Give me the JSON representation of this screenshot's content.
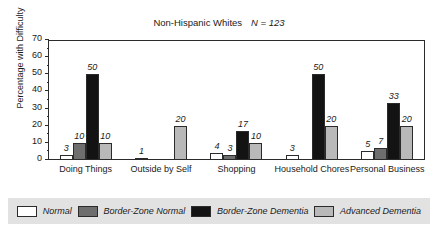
{
  "chart_data": {
    "type": "bar",
    "title": "Non-Hispanic Whites",
    "title_note": "N = 123",
    "xlabel": "",
    "ylabel": "Percentage with Difficulty",
    "ylim": [
      0,
      70
    ],
    "ytick_step": 10,
    "yticks": [
      0,
      10,
      20,
      30,
      40,
      50,
      60,
      70
    ],
    "ytick_labels": [
      "0",
      "10",
      "20",
      "30",
      "40",
      "50",
      "60",
      "70"
    ],
    "grid": false,
    "legend_position": "bottom",
    "categories": [
      "Doing Things",
      "Outside by Self",
      "Shopping",
      "Household Chores",
      "Personal Business"
    ],
    "series": [
      {
        "name": "Normal",
        "color": "#ffffff",
        "values": [
          3,
          1,
          4,
          3,
          5
        ]
      },
      {
        "name": "Border-Zone Normal",
        "color": "#6e6e6e",
        "values": [
          10,
          null,
          3,
          null,
          7
        ]
      },
      {
        "name": "Border-Zone Dementia",
        "color": "#131313",
        "values": [
          50,
          null,
          17,
          50,
          33
        ]
      },
      {
        "name": "Advanced Dementia",
        "color": "#b9b9b9",
        "values": [
          10,
          20,
          10,
          20,
          20
        ]
      }
    ]
  },
  "colors": {
    "axis": "#2b2b2b",
    "legend_band": "#e2e2e2",
    "plot_background": "#ffffff"
  }
}
